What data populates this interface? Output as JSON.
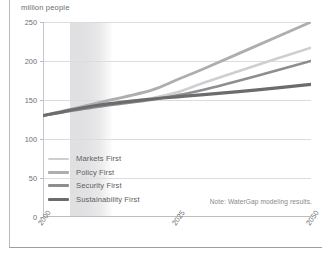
{
  "figure": {
    "unit_title": "million people",
    "note": "Note: WaterGap modeling results."
  },
  "legend": {
    "position": "inside-bottom-left",
    "items": [
      {
        "label": "Markets First",
        "color": "#cfcfd1"
      },
      {
        "label": "Policy First",
        "color": "#aeaeb0"
      },
      {
        "label": "Security First",
        "color": "#8e8e90"
      },
      {
        "label": "Sustainability First",
        "color": "#6c6c6e"
      }
    ]
  },
  "axes": {
    "y_ticks": [
      "0",
      "50",
      "100",
      "150",
      "200",
      "250"
    ],
    "x_ticks": [
      "2000",
      "2025",
      "2050"
    ]
  },
  "chart_data": {
    "type": "line",
    "title": "",
    "subtitle": "",
    "xlabel": "",
    "ylabel": "million people",
    "xlim": [
      2000,
      2050
    ],
    "ylim": [
      0,
      250
    ],
    "grid": true,
    "legend_position": "inside-bottom-left",
    "x": [
      2000,
      2010,
      2020,
      2025,
      2030,
      2040,
      2050
    ],
    "series": [
      {
        "name": "Markets First",
        "color": "#cfcfd1",
        "width": 2.6,
        "values": [
          130,
          142,
          152,
          160,
          172,
          195,
          217
        ]
      },
      {
        "name": "Policy First",
        "color": "#aeaeb0",
        "width": 2.8,
        "values": [
          130,
          146,
          162,
          176,
          190,
          220,
          250
        ]
      },
      {
        "name": "Security First",
        "color": "#8e8e90",
        "width": 2.6,
        "values": [
          130,
          141,
          150,
          156,
          163,
          181,
          200
        ]
      },
      {
        "name": "Sustainability First",
        "color": "#6c6c6e",
        "width": 3.2,
        "values": [
          130,
          143,
          151,
          154,
          157,
          163,
          170
        ]
      }
    ],
    "shaded_band": {
      "x_start": 2005,
      "x_end": 2013,
      "color": "#cdcdd0",
      "fades_right": true
    },
    "annotations": [
      {
        "text": "Note: WaterGap modeling results.",
        "position": "bottom-right"
      }
    ]
  }
}
